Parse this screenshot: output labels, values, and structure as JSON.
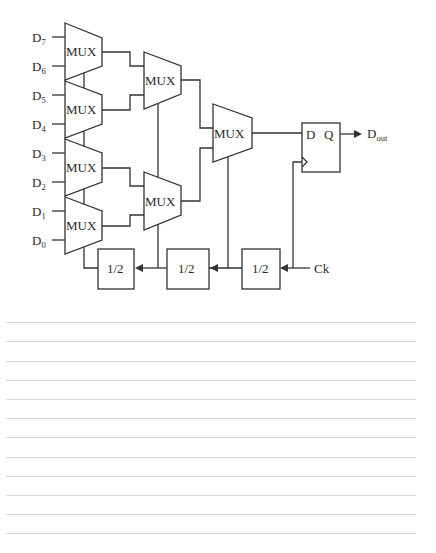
{
  "diagram": {
    "inputs": [
      {
        "name": "D",
        "sub": "7",
        "y": 37
      },
      {
        "name": "D",
        "sub": "6",
        "y": 66
      },
      {
        "name": "D",
        "sub": "5",
        "y": 95
      },
      {
        "name": "D",
        "sub": "4",
        "y": 124
      },
      {
        "name": "D",
        "sub": "3",
        "y": 153
      },
      {
        "name": "D",
        "sub": "2",
        "y": 182
      },
      {
        "name": "D",
        "sub": "1",
        "y": 211
      },
      {
        "name": "D",
        "sub": "0",
        "y": 240
      }
    ],
    "mux_label": "MUX",
    "first_stage_muxes": [
      {
        "id": "mux-d7-d6",
        "label": "MUX"
      },
      {
        "id": "mux-d5-d4",
        "label": "MUX"
      },
      {
        "id": "mux-d3-d2",
        "label": "MUX"
      },
      {
        "id": "mux-d1-d0",
        "label": "MUX"
      }
    ],
    "second_stage_muxes": [
      {
        "id": "mux-upper",
        "label": "MUX"
      },
      {
        "id": "mux-lower",
        "label": "MUX"
      }
    ],
    "final_mux": {
      "id": "mux-final",
      "label": "MUX"
    },
    "flip_flop": {
      "d_label": "D",
      "q_label": "Q"
    },
    "output": {
      "name": "D",
      "sub": "out"
    },
    "dividers": [
      {
        "id": "divider-1",
        "label": "1/2"
      },
      {
        "id": "divider-2",
        "label": "1/2"
      },
      {
        "id": "divider-3",
        "label": "1/2"
      }
    ],
    "clock": {
      "label": "Ck"
    },
    "colors": {
      "stroke": "#333333",
      "text": "#2a2a2a",
      "rule": "#d9d9d9",
      "background": "#ffffff"
    }
  },
  "ruled_lines": {
    "count": 12,
    "positions": [
      322,
      341,
      361,
      380,
      399,
      418,
      437,
      457,
      476,
      495,
      514,
      533
    ]
  }
}
